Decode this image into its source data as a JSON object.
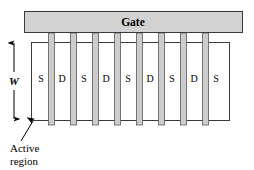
{
  "figure": {
    "name": "multifinger-mosfet-layout",
    "background_color": "#ffffff"
  },
  "gate": {
    "label": "Gate",
    "fill_color": "#d2d2d2",
    "stroke_color": "#3a3a3a",
    "x": 24,
    "y": 11,
    "width": 219,
    "height": 22
  },
  "active_region": {
    "label_line1": "Active",
    "label_line2": "region",
    "fill_color": "#ffffff",
    "stroke_color": "#3a3a3a",
    "x": 31,
    "y": 42,
    "width": 199,
    "height": 79
  },
  "width_dimension": {
    "label": "W",
    "x": 14,
    "y_top": 42,
    "y_bottom": 120
  },
  "fingers": {
    "fill_color": "#cccccc",
    "stroke_color": "#5a5a5a",
    "count": 8,
    "width": 6,
    "y_top": 33,
    "y_bottom": 125,
    "x_positions": [
      48,
      70,
      92,
      114,
      136,
      158,
      180,
      202
    ]
  },
  "terminals": {
    "labels": [
      "S",
      "D",
      "S",
      "D",
      "S",
      "D",
      "S",
      "D",
      "S"
    ],
    "x_positions": [
      41,
      60,
      82,
      104,
      126,
      148,
      170,
      192,
      214
    ],
    "y": 82
  },
  "leader_line": {
    "from_x": 22,
    "from_y": 140,
    "to_x": 34,
    "to_y": 120
  }
}
